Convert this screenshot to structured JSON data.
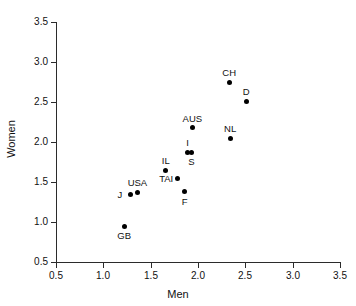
{
  "chart_data": {
    "type": "scatter",
    "title": "",
    "xlabel": "Men",
    "ylabel": "Women",
    "xlim": [
      0.5,
      3.5
    ],
    "ylim": [
      0.5,
      3.5
    ],
    "xticks": [
      "0.5",
      "1.0",
      "1.5",
      "2.0",
      "2.5",
      "3.0",
      "3.5"
    ],
    "yticks": [
      "0.5",
      "1.0",
      "1.5",
      "2.0",
      "2.5",
      "3.0",
      "3.5"
    ],
    "xtick_values": [
      0.5,
      1.0,
      1.5,
      2.0,
      2.5,
      3.0,
      3.5
    ],
    "ytick_values": [
      0.5,
      1.0,
      1.5,
      2.0,
      2.5,
      3.0,
      3.5
    ],
    "grid": false,
    "legend": "none",
    "marker": "filled-circle",
    "marker_color": "#000000",
    "points": [
      {
        "label": "GB",
        "x": 1.22,
        "y": 0.95,
        "label_pos": "below"
      },
      {
        "label": "J",
        "x": 1.29,
        "y": 1.35,
        "label_pos": "left"
      },
      {
        "label": "USA",
        "x": 1.36,
        "y": 1.37,
        "label_pos": "above"
      },
      {
        "label": "IL",
        "x": 1.66,
        "y": 1.65,
        "label_pos": "above"
      },
      {
        "label": "TAI",
        "x": 1.78,
        "y": 1.55,
        "label_pos": "left"
      },
      {
        "label": "F",
        "x": 1.86,
        "y": 1.38,
        "label_pos": "below"
      },
      {
        "label": "I",
        "x": 1.89,
        "y": 1.87,
        "label_pos": "above"
      },
      {
        "label": "S",
        "x": 1.93,
        "y": 1.87,
        "label_pos": "below"
      },
      {
        "label": "AUS",
        "x": 1.94,
        "y": 2.18,
        "label_pos": "above"
      },
      {
        "label": "NL",
        "x": 2.34,
        "y": 2.05,
        "label_pos": "above"
      },
      {
        "label": "CH",
        "x": 2.33,
        "y": 2.75,
        "label_pos": "above"
      },
      {
        "label": "D",
        "x": 2.51,
        "y": 2.51,
        "label_pos": "above"
      }
    ]
  }
}
